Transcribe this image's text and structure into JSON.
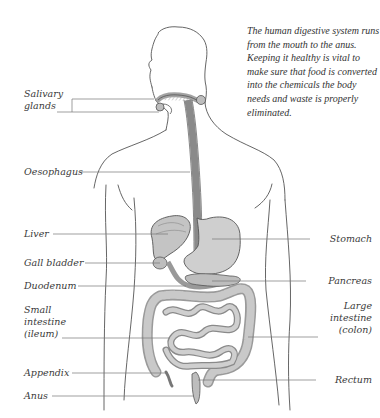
{
  "caption": "The human digestive system runs from the mouth to the anus. Keeping it healthy is vital to make sure that food is converted into the chemicals the body needs and waste is properly eliminated.",
  "labels": {
    "left": [
      {
        "id": "salivary-glands",
        "lines": [
          "Salivary",
          "glands"
        ]
      },
      {
        "id": "oesophagus",
        "lines": [
          "Oesophagus"
        ]
      },
      {
        "id": "liver",
        "lines": [
          "Liver"
        ]
      },
      {
        "id": "gall-bladder",
        "lines": [
          "Gall bladder"
        ]
      },
      {
        "id": "duodenum",
        "lines": [
          "Duodenum"
        ]
      },
      {
        "id": "small-intestine",
        "lines": [
          "Small",
          "intestine",
          "(ileum)"
        ]
      },
      {
        "id": "appendix",
        "lines": [
          "Appendix"
        ]
      },
      {
        "id": "anus",
        "lines": [
          "Anus"
        ]
      }
    ],
    "right": [
      {
        "id": "stomach",
        "lines": [
          "Stomach"
        ]
      },
      {
        "id": "pancreas",
        "lines": [
          "Pancreas"
        ]
      },
      {
        "id": "large-intestine",
        "lines": [
          "Large",
          "intestine",
          "(colon)"
        ]
      },
      {
        "id": "rectum",
        "lines": [
          "Rectum"
        ]
      }
    ]
  },
  "colors": {
    "outline": "#555555",
    "leader": "#777777",
    "organ_fill": "#cfcfcf",
    "organ_dark": "#9a9a9a",
    "text": "#3a3a3a"
  }
}
